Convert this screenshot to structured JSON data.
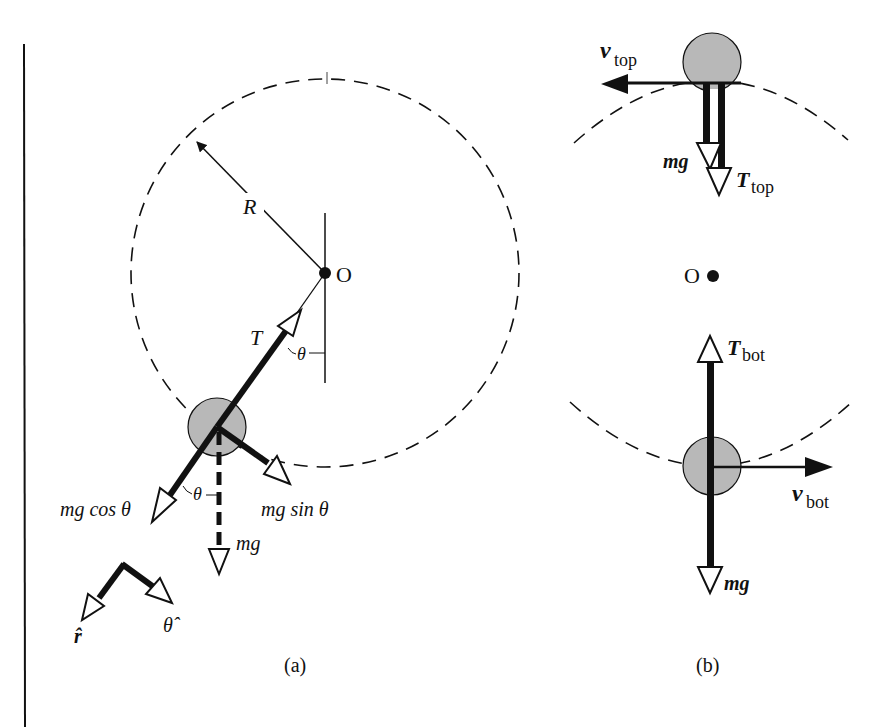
{
  "figure": {
    "panel_a": {
      "caption": "(a)",
      "center_label": "O",
      "radius_label": "R",
      "tension_label": "T",
      "angle_label_top": "θ",
      "angle_label_bottom": "θ",
      "mg_cos_label": "mg cos θ",
      "mg_sin_label": "mg sin θ",
      "mg_label": "mg",
      "r_hat_label": "r̂",
      "theta_hat_label": "θ̂"
    },
    "panel_b": {
      "caption": "(b)",
      "center_label": "O",
      "v_top_label": "v",
      "v_top_sub": "top",
      "mg_top_label": "mg",
      "t_top_label": "T",
      "t_top_sub": "top",
      "t_bot_label": "T",
      "t_bot_sub": "bot",
      "v_bot_label": "v",
      "v_bot_sub": "bot",
      "mg_bot_label": "mg"
    },
    "colors": {
      "ink": "#111111",
      "ball_fill": "#b8b8b8",
      "background": "#ffffff"
    }
  }
}
